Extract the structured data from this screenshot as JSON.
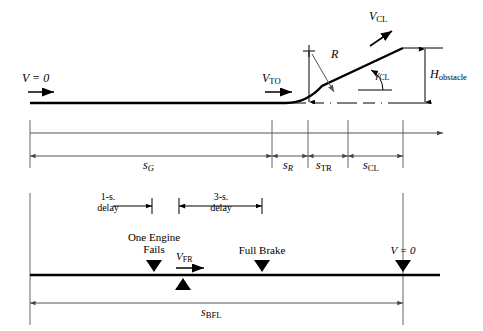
{
  "figure": {
    "stroke_color": "#000000",
    "thin_color": "#555555",
    "background": "#ffffff"
  },
  "upper_diagram": {
    "labels": {
      "v_zero": "V = 0",
      "v_to_base": "V",
      "v_to_sub": "TO",
      "v_cl_base": "V",
      "v_cl_sub": "CL",
      "radius": "R",
      "gamma_base": "γ",
      "gamma_sub": "CL",
      "h_obstacle_base": "H",
      "h_obstacle_sub": "obstacle"
    }
  },
  "distance_axis": {
    "segments": [
      {
        "base": "s",
        "sub": "G",
        "label": "sG"
      },
      {
        "base": "s",
        "sub": "R",
        "label": "sR"
      },
      {
        "base": "s",
        "sub": "TR",
        "label": "sTR"
      },
      {
        "base": "s",
        "sub": "CL",
        "label": "sCL"
      }
    ]
  },
  "lower_diagram": {
    "delays": [
      {
        "line1": "1-s.",
        "line2": "delay"
      },
      {
        "line1": "3-s.",
        "line2": "delay"
      }
    ],
    "events": [
      {
        "line1": "One Engine",
        "line2": "Fails"
      },
      {
        "line1": "Full Brake",
        "line2": ""
      },
      {
        "line1": "V = 0",
        "line2": ""
      }
    ],
    "speed": {
      "base": "V",
      "sub": "FR"
    },
    "total_distance": {
      "base": "s",
      "sub": "BFL",
      "label": "sBFL"
    }
  }
}
